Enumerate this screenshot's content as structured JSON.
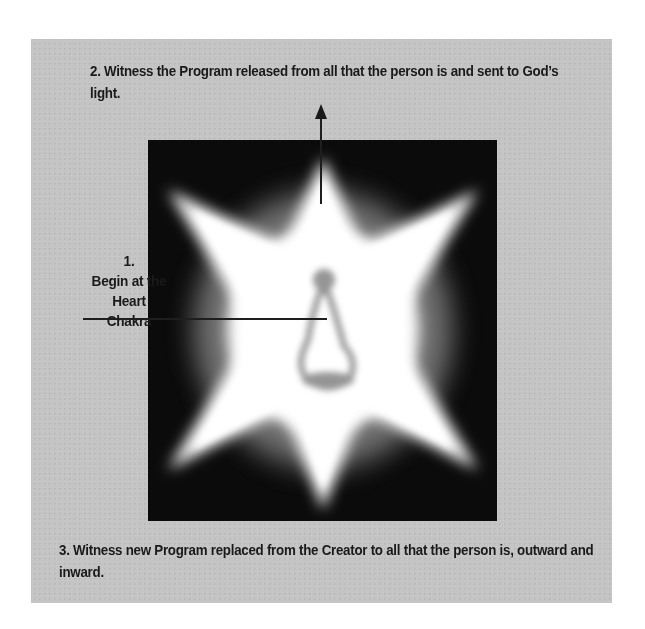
{
  "diagram": {
    "steps": [
      {
        "number": "1.",
        "label_line1": "Begin at the",
        "label_line2": "Heart Chakra"
      },
      {
        "text": "2. Witness the Program released from all that the person is and sent to God’s light."
      },
      {
        "text": "3. Witness new Program replaced from the Creator to all that the person is, outward and inward."
      }
    ],
    "figure": {
      "description": "six-pointed radiant white star on black background with seated meditating figure at center",
      "background_color": "#0b0b0b",
      "star_color": "#ffffff",
      "figure_color": "#8a8a8a"
    },
    "panel_color": "#c4c4c4",
    "annotations": {
      "pointer_line": "horizontal line from step 1 label to heart chakra",
      "arrow": "upward arrow from star top toward step 2 text"
    }
  }
}
